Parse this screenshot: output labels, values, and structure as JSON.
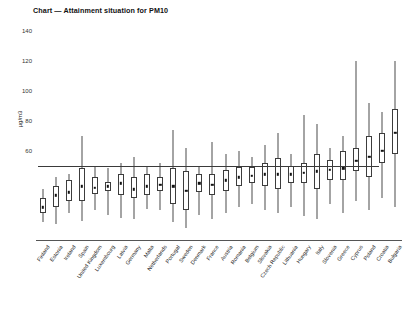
{
  "chart_data": {
    "type": "box",
    "title": "Chart — Attainment situation for PM10",
    "xlabel": "",
    "ylabel": "µg/m3",
    "ylim": [
      0,
      145
    ],
    "yticks": [
      60,
      80,
      100,
      120,
      140
    ],
    "ytick_labels": [
      "60",
      "80",
      "100",
      "120",
      "140"
    ],
    "grid": false,
    "legend": "none",
    "reference_line": {
      "value": 50,
      "label": "PM10 daily limit value",
      "extent_categories": [
        0,
        25
      ]
    },
    "categories": [
      "Finland",
      "Estonia",
      "Ireland",
      "Spain",
      "United Kingdom",
      "Luxembourg",
      "Latvia",
      "Germany",
      "Malta",
      "Netherlands",
      "Portugal",
      "Sweden",
      "Denmark",
      "France",
      "Austria",
      "Romania",
      "Belgium",
      "Slovakia",
      "Czech Republic",
      "Lithuania",
      "Hungary",
      "Italy",
      "Slovenia",
      "Greece",
      "Cyprus",
      "Poland",
      "Croatia",
      "Bulgaria"
    ],
    "series": [
      {
        "name": "PM10 concentration distribution",
        "stats": [
          {
            "category": "Finland",
            "whisker_low": 12,
            "q1": 18,
            "median": 22,
            "q3": 28,
            "whisker_high": 34
          },
          {
            "category": "Estonia",
            "whisker_low": 11,
            "q1": 22,
            "median": 30,
            "q3": 36,
            "whisker_high": 42
          },
          {
            "category": "Ireland",
            "whisker_low": 18,
            "q1": 26,
            "median": 32,
            "q3": 40,
            "whisker_high": 44
          },
          {
            "category": "Spain",
            "whisker_low": 13,
            "q1": 26,
            "median": 36,
            "q3": 48,
            "whisker_high": 70
          },
          {
            "category": "United Kingdom",
            "whisker_low": 20,
            "q1": 31,
            "median": 35,
            "q3": 42,
            "whisker_high": 50
          },
          {
            "category": "Luxembourg",
            "whisker_low": 17,
            "q1": 33,
            "median": 36,
            "q3": 39,
            "whisker_high": 48
          },
          {
            "category": "Latvia",
            "whisker_low": 15,
            "q1": 30,
            "median": 38,
            "q3": 44,
            "whisker_high": 52
          },
          {
            "category": "Germany",
            "whisker_low": 14,
            "q1": 28,
            "median": 34,
            "q3": 42,
            "whisker_high": 56
          },
          {
            "category": "Malta",
            "whisker_low": 21,
            "q1": 30,
            "median": 36,
            "q3": 44,
            "whisker_high": 50
          },
          {
            "category": "Netherlands",
            "whisker_low": 20,
            "q1": 33,
            "median": 37,
            "q3": 42,
            "whisker_high": 52
          },
          {
            "category": "Portugal",
            "whisker_low": 12,
            "q1": 24,
            "median": 36,
            "q3": 48,
            "whisker_high": 74
          },
          {
            "category": "Sweden",
            "whisker_low": 8,
            "q1": 20,
            "median": 33,
            "q3": 46,
            "whisker_high": 62
          },
          {
            "category": "Denmark",
            "whisker_low": 17,
            "q1": 32,
            "median": 38,
            "q3": 44,
            "whisker_high": 50
          },
          {
            "category": "France",
            "whisker_low": 14,
            "q1": 30,
            "median": 37,
            "q3": 44,
            "whisker_high": 66
          },
          {
            "category": "Austria",
            "whisker_low": 18,
            "q1": 33,
            "median": 40,
            "q3": 47,
            "whisker_high": 58
          },
          {
            "category": "Romania",
            "whisker_low": 22,
            "q1": 36,
            "median": 42,
            "q3": 49,
            "whisker_high": 60
          },
          {
            "category": "Belgium",
            "whisker_low": 24,
            "q1": 38,
            "median": 43,
            "q3": 49,
            "whisker_high": 56
          },
          {
            "category": "Slovakia",
            "whisker_low": 20,
            "q1": 36,
            "median": 44,
            "q3": 52,
            "whisker_high": 64
          },
          {
            "category": "Czech Republic",
            "whisker_low": 18,
            "q1": 34,
            "median": 44,
            "q3": 55,
            "whisker_high": 72
          },
          {
            "category": "Lithuania",
            "whisker_low": 22,
            "q1": 38,
            "median": 44,
            "q3": 50,
            "whisker_high": 58
          },
          {
            "category": "Hungary",
            "whisker_low": 16,
            "q1": 38,
            "median": 45,
            "q3": 52,
            "whisker_high": 84
          },
          {
            "category": "Italy",
            "whisker_low": 14,
            "q1": 34,
            "median": 46,
            "q3": 58,
            "whisker_high": 78
          },
          {
            "category": "Slovenia",
            "whisker_low": 24,
            "q1": 40,
            "median": 47,
            "q3": 54,
            "whisker_high": 62
          },
          {
            "category": "Greece",
            "whisker_low": 18,
            "q1": 40,
            "median": 48,
            "q3": 60,
            "whisker_high": 70
          },
          {
            "category": "Cyprus",
            "whisker_low": 26,
            "q1": 46,
            "median": 53,
            "q3": 62,
            "whisker_high": 120
          },
          {
            "category": "Poland",
            "whisker_low": 20,
            "q1": 42,
            "median": 56,
            "q3": 70,
            "whisker_high": 92
          },
          {
            "category": "Croatia",
            "whisker_low": 28,
            "q1": 52,
            "median": 60,
            "q3": 72,
            "whisker_high": 86
          },
          {
            "category": "Bulgaria",
            "whisker_low": 22,
            "q1": 58,
            "median": 72,
            "q3": 88,
            "whisker_high": 120
          }
        ]
      }
    ]
  }
}
